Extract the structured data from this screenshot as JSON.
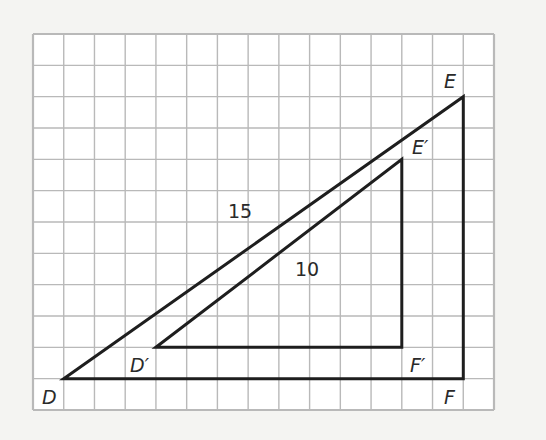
{
  "diagram": {
    "type": "similar-triangles-on-grid",
    "grid": {
      "columns": 15,
      "rows": 12,
      "line_color": "#b9b9b9",
      "background": "#ffffff"
    },
    "triangles": [
      {
        "name": "DEF",
        "vertices": {
          "D": {
            "col": 1,
            "row": 11,
            "label": "D"
          },
          "E": {
            "col": 14,
            "row": 2,
            "label": "E"
          },
          "F": {
            "col": 14,
            "row": 11,
            "label": "F"
          }
        },
        "side_label": "15"
      },
      {
        "name": "D'E'F'",
        "vertices": {
          "D": {
            "col": 4,
            "row": 10,
            "label": "D′"
          },
          "E": {
            "col": 12,
            "row": 4,
            "label": "E′"
          },
          "F": {
            "col": 12,
            "row": 10,
            "label": "F′"
          }
        },
        "side_label": "10"
      }
    ],
    "line_color": "#1e1e1e"
  }
}
